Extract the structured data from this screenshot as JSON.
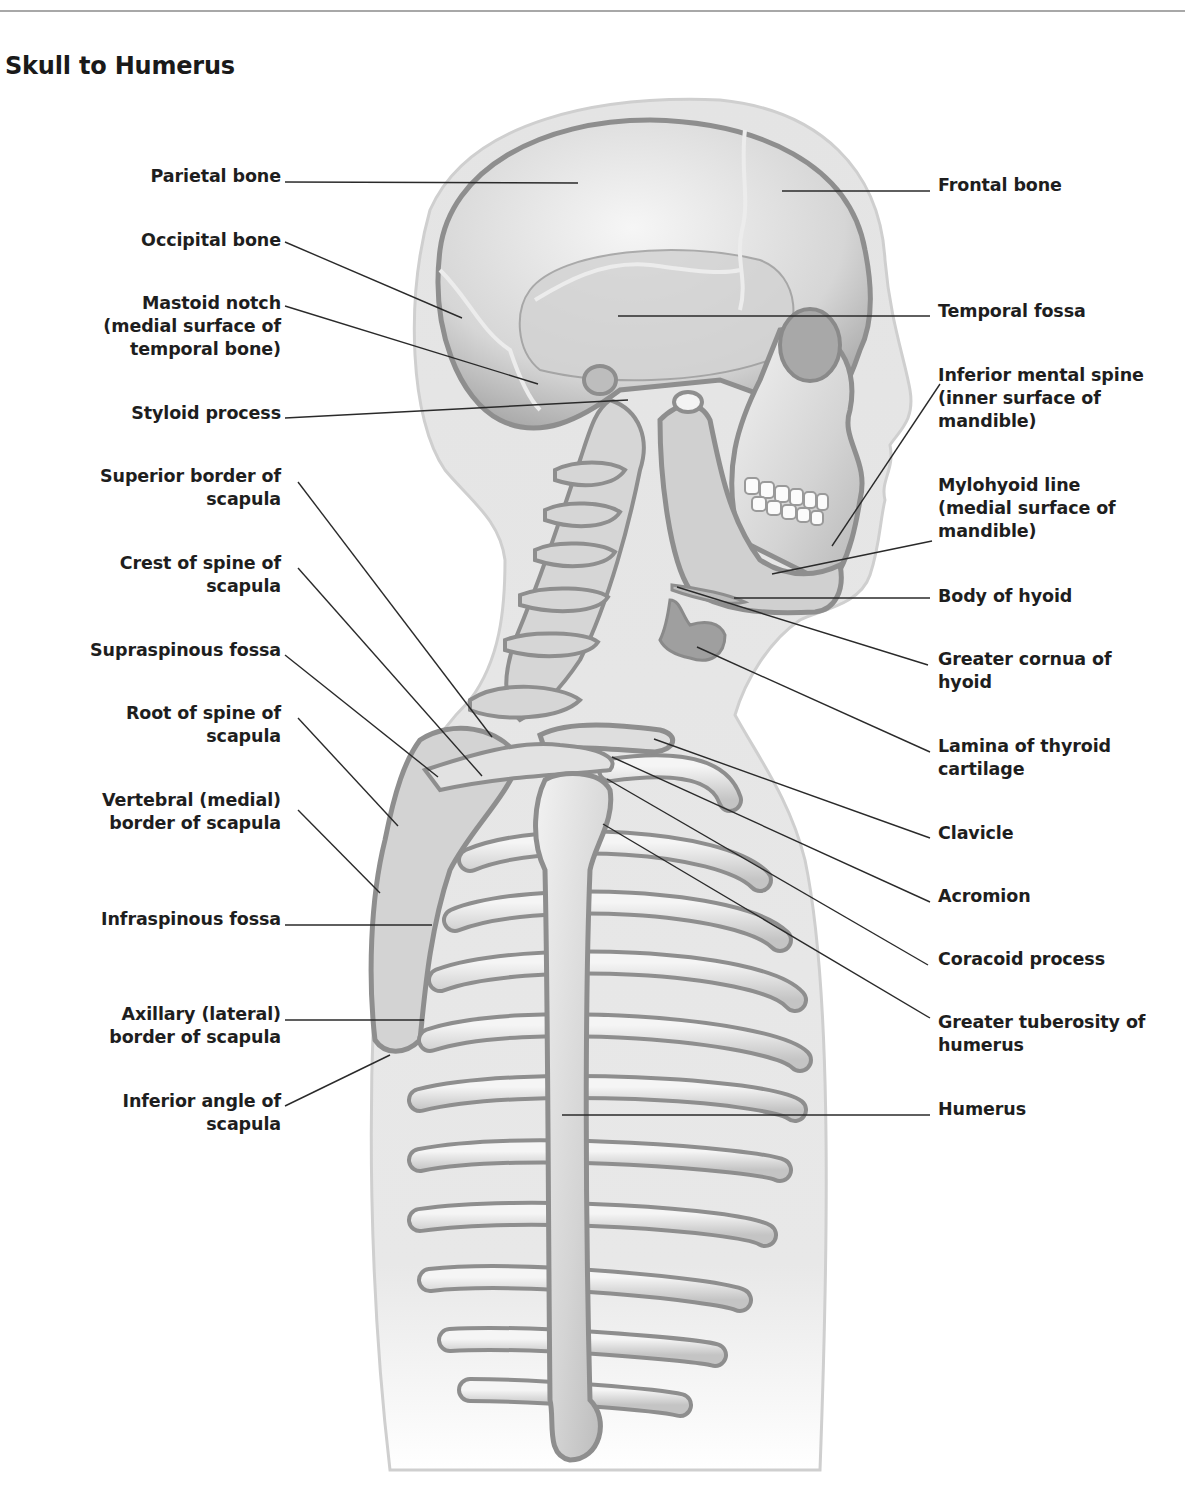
{
  "title": "Skull to Humerus",
  "colors": {
    "text": "#1e1e1e",
    "rule": "#a8a8a8",
    "body_silhouette": "#e6e6e6",
    "silhouette_edge": "#c9c9c9",
    "bone_fill": "#dcdcdc",
    "bone_highlight": "#f4f4f4",
    "bone_outline": "#8e8e8e",
    "leader_line": "#2a2a2a"
  },
  "labels": {
    "left": [
      {
        "id": "parietal-bone",
        "text": "Parietal bone",
        "top": 165
      },
      {
        "id": "occipital-bone",
        "text": "Occipital bone",
        "top": 229
      },
      {
        "id": "mastoid-notch",
        "text": "Mastoid notch\n(medial surface of\ntemporal bone)",
        "top": 292
      },
      {
        "id": "styloid-process",
        "text": "Styloid process",
        "top": 402
      },
      {
        "id": "superior-border-of-scapula",
        "text": "Superior border of\nscapula",
        "top": 465
      },
      {
        "id": "crest-of-spine-of-scapula",
        "text": "Crest of spine of\nscapula",
        "top": 552
      },
      {
        "id": "supraspinous-fossa",
        "text": "Supraspinous fossa",
        "top": 639
      },
      {
        "id": "root-of-spine-of-scapula",
        "text": "Root of spine of\nscapula",
        "top": 702
      },
      {
        "id": "vertebral-medial-border-of-scapula",
        "text": "Vertebral (medial)\nborder of scapula",
        "top": 789
      },
      {
        "id": "infraspinous-fossa",
        "text": "Infraspinous fossa",
        "top": 908
      },
      {
        "id": "axillary-lateral-border-of-scapula",
        "text": "Axillary (lateral)\nborder of scapula",
        "top": 1003
      },
      {
        "id": "inferior-angle-of-scapula",
        "text": "Inferior angle of\nscapula",
        "top": 1090
      }
    ],
    "right": [
      {
        "id": "frontal-bone",
        "text": "Frontal bone",
        "top": 174
      },
      {
        "id": "temporal-fossa",
        "text": "Temporal fossa",
        "top": 300
      },
      {
        "id": "inferior-mental-spine",
        "text": "Inferior mental spine\n(inner surface of\nmandible)",
        "top": 364
      },
      {
        "id": "mylohyoid-line",
        "text": "Mylohyoid line\n(medial surface of\nmandible)",
        "top": 474
      },
      {
        "id": "body-of-hyoid",
        "text": "Body of hyoid",
        "top": 585
      },
      {
        "id": "greater-cornua-of-hyoid",
        "text": "Greater cornua of\nhyoid",
        "top": 648
      },
      {
        "id": "lamina-of-thyroid-cartilage",
        "text": "Lamina of thyroid\ncartilage",
        "top": 735
      },
      {
        "id": "clavicle",
        "text": "Clavicle",
        "top": 822
      },
      {
        "id": "acromion",
        "text": "Acromion",
        "top": 885
      },
      {
        "id": "coracoid-process",
        "text": "Coracoid process",
        "top": 948
      },
      {
        "id": "greater-tuberosity-of-humerus",
        "text": "Greater tuberosity of\nhumerus",
        "top": 1011
      },
      {
        "id": "humerus",
        "text": "Humerus",
        "top": 1098
      }
    ]
  }
}
